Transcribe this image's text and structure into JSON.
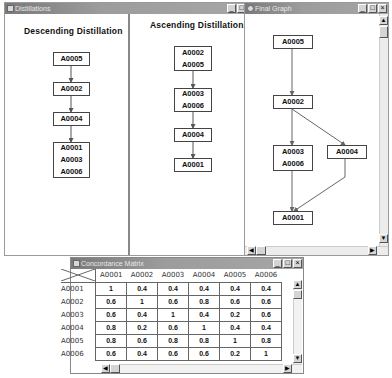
{
  "distillations_window": {
    "title": "Distillations",
    "controls": [
      "minimize",
      "maximize"
    ],
    "descending": {
      "title": "Descending  Distillation",
      "nodes": [
        {
          "lines": [
            "A0005"
          ]
        },
        {
          "lines": [
            "A0002"
          ]
        },
        {
          "lines": [
            "A0004"
          ]
        },
        {
          "lines": [
            "A0001",
            "A0003",
            "A0006"
          ]
        }
      ]
    },
    "ascending": {
      "title": "Ascending  Distillation",
      "nodes": [
        {
          "lines": [
            "A0002",
            "A0005"
          ]
        },
        {
          "lines": [
            "A0003",
            "A0006"
          ]
        },
        {
          "lines": [
            "A0004"
          ]
        },
        {
          "lines": [
            "A0001"
          ]
        }
      ]
    }
  },
  "final_graph_window": {
    "title": "Final Graph",
    "controls": [
      "minimize",
      "maximize",
      "close"
    ],
    "nodes": {
      "n1": {
        "lines": [
          "A0005"
        ]
      },
      "n2": {
        "lines": [
          "A0002"
        ]
      },
      "n3": {
        "lines": [
          "A0003",
          "A0006"
        ]
      },
      "n4": {
        "lines": [
          "A0004"
        ]
      },
      "n5": {
        "lines": [
          "A0001"
        ]
      }
    },
    "edges": [
      [
        "n1",
        "n2"
      ],
      [
        "n2",
        "n3"
      ],
      [
        "n2",
        "n4"
      ],
      [
        "n3",
        "n5"
      ],
      [
        "n4",
        "n5"
      ]
    ]
  },
  "matrix_window": {
    "title": "Concordance Matrix",
    "controls": [
      "minimize",
      "maximize",
      "close"
    ],
    "columns": [
      "A0001",
      "A0002",
      "A0003",
      "A0004",
      "A0005",
      "A0006"
    ],
    "rows": [
      {
        "label": "A0001",
        "values": [
          "1",
          "0.4",
          "0.4",
          "0.4",
          "0.4",
          "0.4"
        ]
      },
      {
        "label": "A0002",
        "values": [
          "0.6",
          "1",
          "0.6",
          "0.8",
          "0.6",
          "0.6"
        ]
      },
      {
        "label": "A0003",
        "values": [
          "0.6",
          "0.4",
          "1",
          "0.4",
          "0.2",
          "0.6"
        ]
      },
      {
        "label": "A0004",
        "values": [
          "0.8",
          "0.2",
          "0.6",
          "1",
          "0.4",
          "0.4"
        ]
      },
      {
        "label": "A0005",
        "values": [
          "0.8",
          "0.6",
          "0.8",
          "0.8",
          "1",
          "0.8"
        ]
      },
      {
        "label": "A0006",
        "values": [
          "0.6",
          "0.4",
          "0.6",
          "0.6",
          "0.2",
          "1"
        ]
      }
    ]
  },
  "icons": {
    "minimize": "_",
    "maximize": "□",
    "close": "×",
    "scroll_up": "▲",
    "scroll_down": "▼",
    "scroll_left": "◀",
    "scroll_right": "▶"
  }
}
